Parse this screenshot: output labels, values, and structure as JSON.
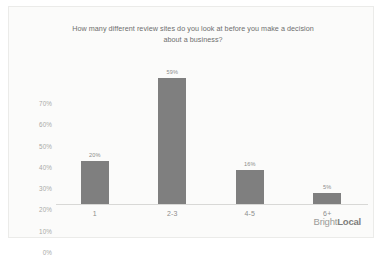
{
  "chart_data": {
    "type": "bar",
    "title": "How many different review sites do you look at before you make a decision about a business?",
    "title_line1": "How many different review sites do you look at before you make a decision",
    "title_line2": "about a business?",
    "categories": [
      "1",
      "2-3",
      "4-5",
      "6+"
    ],
    "values": [
      20,
      59,
      16,
      5
    ],
    "value_labels": [
      "20%",
      "59%",
      "16%",
      "5%"
    ],
    "xlabel": "",
    "ylabel": "",
    "ylim": [
      0,
      70
    ],
    "ytick_labels": [
      "70%",
      "60%",
      "50%",
      "40%",
      "30%",
      "20%",
      "10%",
      "0%"
    ],
    "ytick_values": [
      70,
      60,
      50,
      40,
      30,
      20,
      10,
      0
    ],
    "grid": false,
    "legend": "none",
    "bar_color": "#7f7f7f",
    "background_color": "#fbfbfa",
    "text_color": "#6e6e6e"
  },
  "footer": {
    "brand_light": "Bright",
    "brand_bold": "Local"
  }
}
